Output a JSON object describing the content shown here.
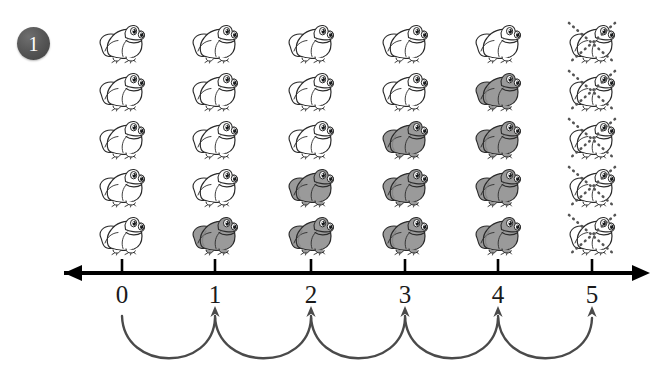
{
  "page": {
    "background_color": "#ffffff",
    "width": 661,
    "height": 384
  },
  "exercise": {
    "number_badge": "1",
    "badge_color": "#4f4f4f",
    "badge_text_color": "#ffffff"
  },
  "colors": {
    "outline": "#2b2b2b",
    "frog_white_fill": "#ffffff",
    "frog_gray_fill": "#9a9a9a",
    "frog_gray_shadow": "#7f7f7f",
    "axis": "#000000",
    "arc": "#4a4a4a",
    "cross_out": "#555555"
  },
  "number_line": {
    "orientation": "horizontal",
    "has_left_arrowhead": true,
    "has_right_arrowhead": true,
    "tick_labels": [
      "0",
      "1",
      "2",
      "3",
      "4",
      "5"
    ],
    "tick_positions_px": [
      122,
      215,
      311,
      405,
      498,
      592
    ],
    "axis_y_px": 273
  },
  "jumps": {
    "description": "curved arrows below the number line",
    "count": 5,
    "arrow_direction": "up",
    "arcs": [
      {
        "from_label": "0",
        "to_label": "1",
        "from_x": 122,
        "to_x": 215
      },
      {
        "from_label": "1",
        "to_label": "2",
        "from_x": 215,
        "to_x": 311
      },
      {
        "from_label": "2",
        "to_label": "3",
        "from_x": 311,
        "to_x": 405
      },
      {
        "from_label": "3",
        "to_label": "4",
        "from_x": 405,
        "to_x": 498
      },
      {
        "from_label": "4",
        "to_label": "5",
        "from_x": 498,
        "to_x": 592
      }
    ]
  },
  "frog_grid": {
    "rows": 5,
    "columns": 6,
    "column_x_px": [
      122,
      215,
      311,
      405,
      498,
      592
    ],
    "row_y_px": [
      20,
      68,
      116,
      164,
      212
    ],
    "legend": {
      "white": "outline frog (not yet counted)",
      "gray": "shaded frog (counted)",
      "crossed": "outline frog crossed out with dotted X"
    },
    "columns_data": [
      {
        "label": "0",
        "gray_count": 0,
        "white_count": 5,
        "crossed": false,
        "states": [
          "white",
          "white",
          "white",
          "white",
          "white"
        ]
      },
      {
        "label": "1",
        "gray_count": 1,
        "white_count": 4,
        "crossed": false,
        "states": [
          "white",
          "white",
          "white",
          "white",
          "gray"
        ]
      },
      {
        "label": "2",
        "gray_count": 2,
        "white_count": 3,
        "crossed": false,
        "states": [
          "white",
          "white",
          "white",
          "gray",
          "gray"
        ]
      },
      {
        "label": "3",
        "gray_count": 3,
        "white_count": 2,
        "crossed": false,
        "states": [
          "white",
          "white",
          "gray",
          "gray",
          "gray"
        ]
      },
      {
        "label": "4",
        "gray_count": 4,
        "white_count": 1,
        "crossed": false,
        "states": [
          "white",
          "gray",
          "gray",
          "gray",
          "gray"
        ]
      },
      {
        "label": "5",
        "gray_count": 0,
        "white_count": 5,
        "crossed": true,
        "states": [
          "crossed",
          "crossed",
          "crossed",
          "crossed",
          "crossed"
        ]
      }
    ]
  }
}
